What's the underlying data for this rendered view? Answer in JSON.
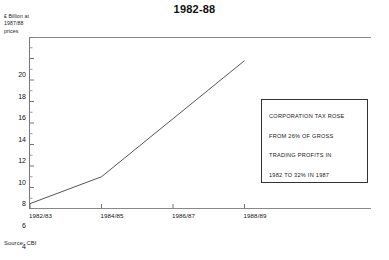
{
  "chart_data": {
    "type": "line",
    "title": "1982-88",
    "xlabel": "",
    "ylabel": "£ Billion at 1987/88 prices",
    "ylabel_lines": [
      "£ Billion at",
      "1987/88",
      "prices"
    ],
    "categories": [
      "1982/83",
      "1984/85",
      "1986/87",
      "1988/89"
    ],
    "x": [
      1982.5,
      1984.5,
      1986.5,
      1988.5
    ],
    "values": [
      4.5,
      7.0,
      12.4,
      17.8
    ],
    "series": [
      {
        "name": "Corporation tax receipts",
        "values": [
          4.5,
          7.0,
          12.4,
          17.8
        ]
      }
    ],
    "ylim": [
      4,
      20
    ],
    "xlim": [
      "1982/83",
      "1989/90"
    ],
    "yticks": [
      20,
      18,
      16,
      14,
      12,
      10,
      8,
      6,
      4
    ],
    "ytick_labels": [
      "20",
      "18",
      "16",
      "14",
      "12",
      "10",
      "8",
      "6",
      "4"
    ],
    "grid": false,
    "legend": false,
    "line_color": "#555555",
    "axis_color": "#777777",
    "annotations": [
      "CORPORATION TAX ROSE",
      "FROM 26% OF GROSS",
      "TRADING PROFITS IN",
      "1982 TO 32% IN 1987"
    ],
    "source": "Source: CBI"
  }
}
